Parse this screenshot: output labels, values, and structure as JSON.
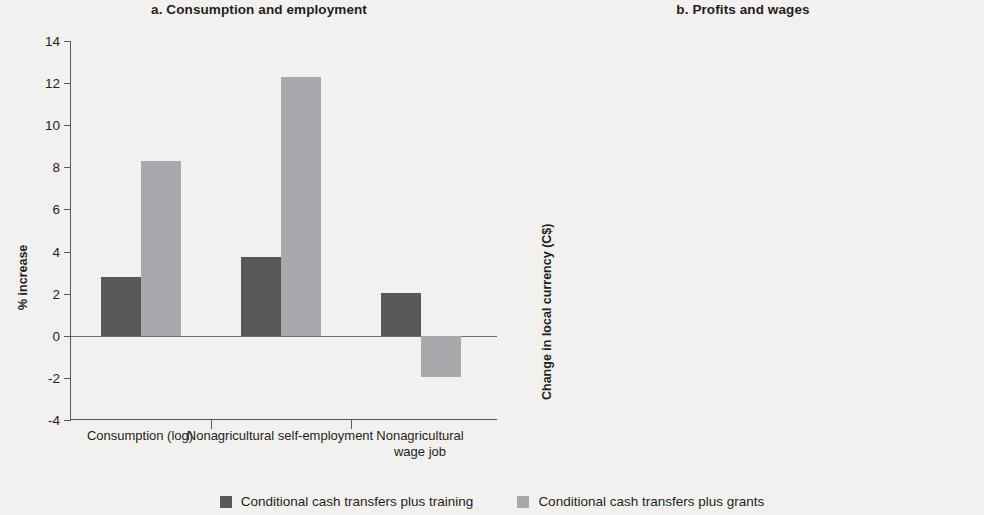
{
  "figure": {
    "background_color": "#f2f1ef",
    "series_colors": {
      "dark": "#58585b",
      "light": "#a7a9ac"
    }
  },
  "legend": {
    "items": [
      {
        "label": "Conditional cash transfers plus training",
        "swatch": "dark-swatch-icon"
      },
      {
        "label": "Conditional cash transfers plus grants",
        "swatch": "light-swatch-icon"
      }
    ]
  },
  "panel_a": {
    "title": "a.  Consumption and employment",
    "ylabel": "% increase",
    "yticks": [
      "14",
      "12",
      "10",
      "8",
      "6",
      "4",
      "2",
      "0",
      "-2",
      "-4"
    ],
    "categories": [
      "Consumption (log)",
      "Nonagricultural\nself-employment",
      "Nonagricultural\nwage job"
    ]
  },
  "panel_b": {
    "title": "b.  Profits and wages",
    "ylabel": "Change in local currency (C$)",
    "yticks": [
      "1,400",
      "1,200",
      "1,000",
      "800",
      "600",
      "400",
      "200",
      "0",
      "-200",
      "-400"
    ],
    "categories": [
      "Profits in nonagricultural\nself-employment",
      "Wage in private jobs"
    ]
  },
  "chart_data": [
    {
      "type": "bar",
      "panel": "a",
      "title": "a.  Consumption and employment",
      "xlabel": "",
      "ylabel": "% increase",
      "ylim": [
        -4,
        14
      ],
      "ytick_values": [
        -4,
        -2,
        0,
        2,
        4,
        6,
        8,
        10,
        12,
        14
      ],
      "grid": false,
      "legend_position": "bottom-center",
      "categories": [
        "Consumption (log)",
        "Nonagricultural self-employment",
        "Nonagricultural wage job"
      ],
      "series": [
        {
          "name": "Conditional cash transfers plus training",
          "color": "#58585b",
          "values": [
            2.8,
            3.75,
            2.05
          ]
        },
        {
          "name": "Conditional cash transfers plus grants",
          "color": "#a7a9ac",
          "values": [
            8.3,
            12.3,
            -1.95
          ]
        }
      ]
    },
    {
      "type": "bar",
      "panel": "b",
      "title": "b.  Profits and wages",
      "xlabel": "",
      "ylabel": "Change in local currency (C$)",
      "ylim": [
        -400,
        1400
      ],
      "ytick_values": [
        -400,
        -200,
        0,
        200,
        400,
        600,
        800,
        1000,
        1200,
        1400
      ],
      "grid": false,
      "legend_position": "bottom-center",
      "categories": [
        "Profits in nonagricultural self-employment",
        "Wage in private jobs"
      ],
      "series": [
        {
          "name": "Conditional cash transfers plus training",
          "color": "#58585b",
          "values": [
            -300,
            920
          ]
        },
        {
          "name": "Conditional cash transfers plus grants",
          "color": "#a7a9ac",
          "values": [
            600,
            -300
          ]
        }
      ]
    }
  ]
}
